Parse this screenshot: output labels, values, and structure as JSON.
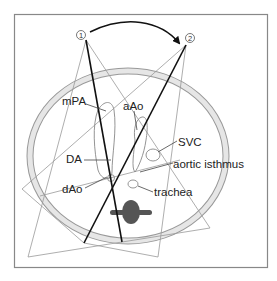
{
  "figure": {
    "positions": [
      {
        "id": "1",
        "label": "1"
      },
      {
        "id": "2",
        "label": "2"
      }
    ],
    "labels": {
      "mPA": "mPA",
      "aAo": "aAo",
      "SVC": "SVC",
      "aortic_isthmus": "aortic isthmus",
      "DA": "DA",
      "dAo": "dAo",
      "trachea": "trachea"
    },
    "colors": {
      "frame": "#888888",
      "chest_wall_fill": "#e6e6e6",
      "chest_wall_stroke": "#999999",
      "thin_lines": "#999999",
      "thick_lines": "#111111",
      "vessel_outline": "#888888",
      "spine": "#555555"
    }
  }
}
